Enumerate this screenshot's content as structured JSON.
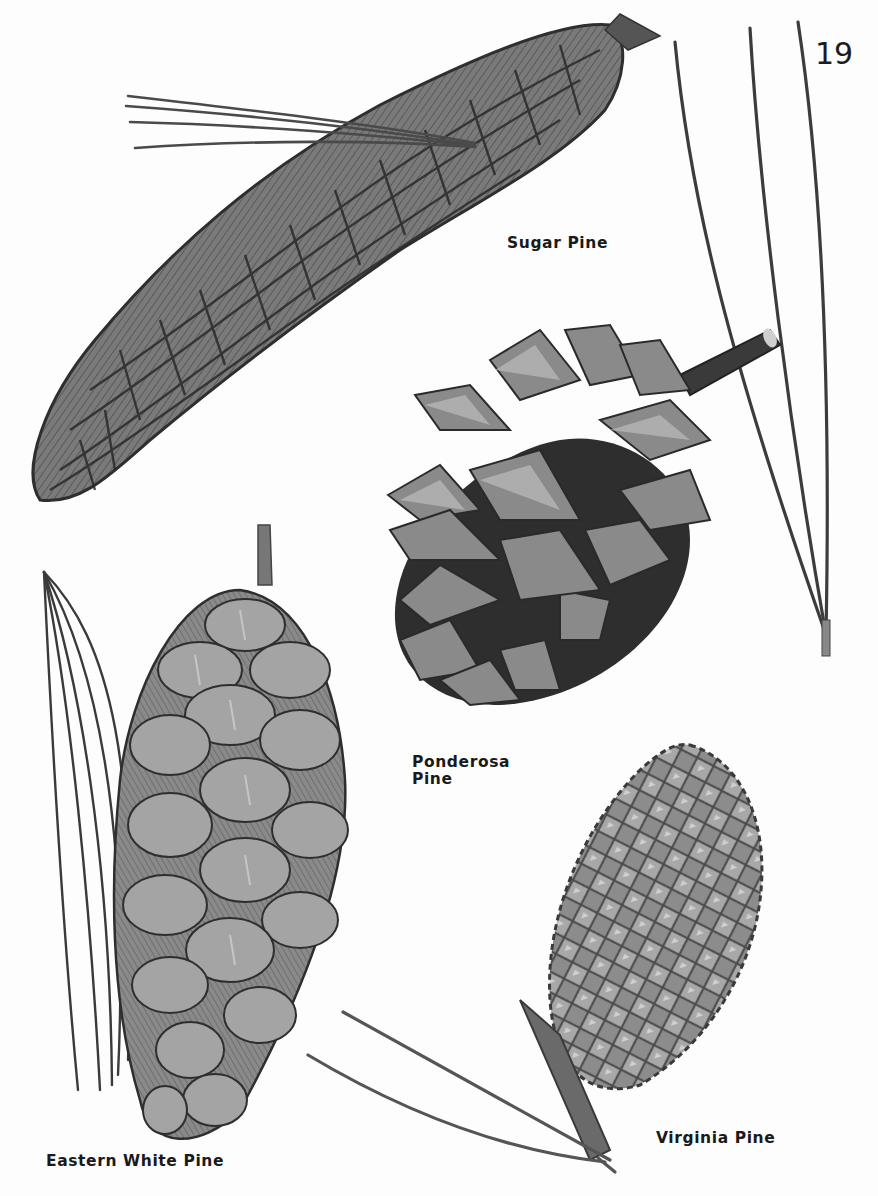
{
  "page": {
    "number": "19",
    "background": "#fdfdfd",
    "ink_color": "#1a1a1a"
  },
  "illustrations": [
    {
      "id": "sugar-pine",
      "label": "Sugar Pine",
      "description": "long curved cone with attached needle bundle"
    },
    {
      "id": "ponderosa-pine",
      "label_line1": "Ponderosa",
      "label_line2": "Pine",
      "description": "open cone with spiky scales on stem, three long needles"
    },
    {
      "id": "eastern-white-pine",
      "label": "Eastern White Pine",
      "description": "slender drooping cone with soft scales, bundle of five needles"
    },
    {
      "id": "virginia-pine",
      "label": "Virginia Pine",
      "description": "small oval prickly cone with two needles"
    }
  ]
}
